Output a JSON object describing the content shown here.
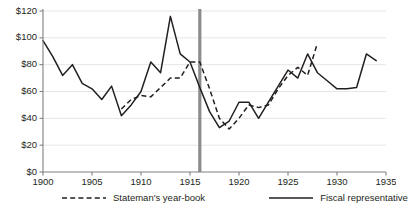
{
  "chart_data": {
    "type": "line",
    "title": "",
    "xlabel": "",
    "ylabel": "",
    "xlim": [
      1900,
      1935
    ],
    "ylim": [
      0,
      120
    ],
    "grid": true,
    "legend_position": "bottom",
    "y_ticks": [
      "$0",
      "$20",
      "$40",
      "$60",
      "$80",
      "$100",
      "$120"
    ],
    "y_tick_values": [
      0,
      20,
      40,
      60,
      80,
      100,
      120
    ],
    "x_ticks": [
      "1900",
      "1905",
      "1910",
      "1915",
      "1920",
      "1925",
      "1930",
      "1935"
    ],
    "x_tick_values": [
      1900,
      1905,
      1910,
      1915,
      1920,
      1925,
      1930,
      1935
    ],
    "annotations": [
      {
        "name": "event-marker",
        "type": "vline",
        "x": 1916,
        "label": "",
        "color": "#8c8c8c"
      }
    ],
    "series": [
      {
        "name": "Fiscal representative",
        "style": "solid",
        "color": "#231f20",
        "x": [
          1900,
          1901,
          1902,
          1903,
          1904,
          1905,
          1906,
          1907,
          1908,
          1909,
          1910,
          1911,
          1912,
          1913,
          1914,
          1915,
          1916,
          1917,
          1918,
          1919,
          1920,
          1921,
          1922,
          1923,
          1924,
          1925,
          1926,
          1927,
          1928,
          1929,
          1930,
          1931,
          1932,
          1933,
          1934
        ],
        "values": [
          98,
          86,
          72,
          80,
          66,
          62,
          54,
          64,
          42,
          50,
          60,
          82,
          74,
          116,
          88,
          82,
          63,
          45,
          33,
          38,
          52,
          52,
          40,
          52,
          64,
          76,
          70,
          88,
          74,
          68,
          62,
          62,
          63,
          88,
          83
        ]
      },
      {
        "name": "Stateman's year-book",
        "style": "dashed",
        "color": "#231f20",
        "x": [
          1908,
          1909,
          1910,
          1911,
          1912,
          1913,
          1914,
          1915,
          1916,
          1917,
          1918,
          1919,
          1920,
          1921,
          1922,
          1923,
          1924,
          1925,
          1926,
          1927,
          1928
        ],
        "values": [
          47,
          54,
          57,
          56,
          63,
          70,
          70,
          82,
          82,
          62,
          40,
          32,
          40,
          50,
          48,
          50,
          62,
          72,
          78,
          72,
          96
        ]
      }
    ]
  },
  "legend": {
    "items": [
      {
        "label": "Stateman's year-book",
        "style": "dashed"
      },
      {
        "label": "Fiscal representative",
        "style": "solid"
      }
    ]
  }
}
